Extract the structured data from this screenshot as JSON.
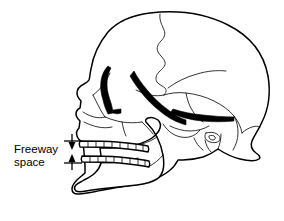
{
  "figure": {
    "type": "anatomical-line-drawing",
    "background_color": "#ffffff",
    "line_color": "#000000"
  },
  "annotation": {
    "label_line1": "Freeway",
    "label_line2": "space",
    "measurement_name": "Freeway space",
    "indicator": {
      "type": "vertical-dimension",
      "top_arrow_direction": "down",
      "bottom_arrow_direction": "up",
      "measures": "interocclusal gap between upper and lower teeth"
    }
  },
  "anatomy": {
    "structures": [
      "cranial vault",
      "coronal suture",
      "frontal bone",
      "parietal bone",
      "temporal bone",
      "occipital bone",
      "orbit",
      "nasal aperture",
      "zygomatic arch",
      "maxilla",
      "upper teeth",
      "lower teeth",
      "mandible",
      "mandibular ramus",
      "condyle",
      "coronoid process",
      "mastoid process"
    ]
  },
  "teeth": {
    "upper_count": 8,
    "lower_count": 8
  }
}
